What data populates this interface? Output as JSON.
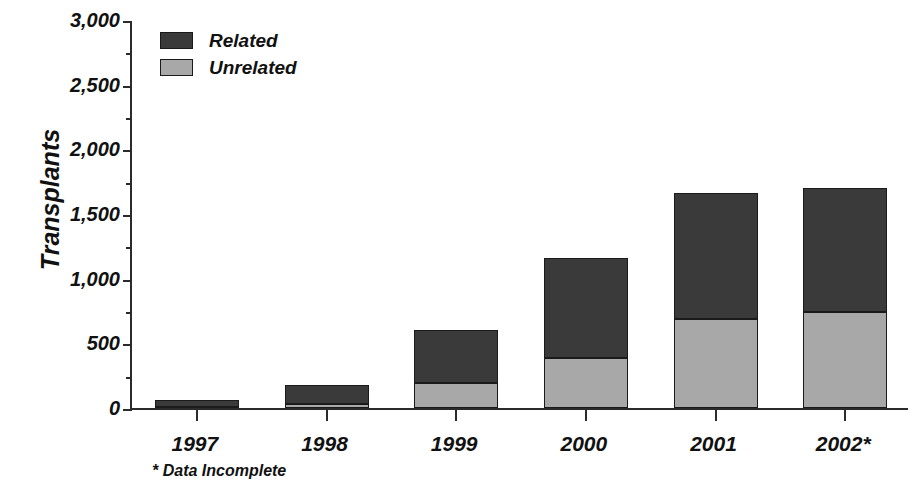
{
  "chart_data": {
    "type": "bar",
    "subtype": "stacked-bar",
    "title": "",
    "xlabel": "",
    "ylabel": "Transplants",
    "categories": [
      "1997",
      "1998",
      "1999",
      "2000",
      "2001",
      "2002*"
    ],
    "series": [
      {
        "name": "Unrelated",
        "color": "#a8a8a8",
        "values": [
          10,
          30,
          190,
          385,
          685,
          740
        ]
      },
      {
        "name": "Related",
        "color": "#3a3a3a",
        "values": [
          50,
          150,
          410,
          775,
          975,
          960
        ]
      }
    ],
    "totals": [
      60,
      180,
      600,
      1160,
      1660,
      1700
    ],
    "ylim": [
      0,
      3000
    ],
    "y_ticks": [
      0,
      500,
      1000,
      1500,
      2000,
      2500,
      3000
    ],
    "y_tick_labels": [
      "0",
      "500",
      "1,000",
      "1,500",
      "2,000",
      "2,500",
      "3,000"
    ],
    "y_minor_tick_interval": 250,
    "grid": false,
    "legend_position": "top-left-inside",
    "stack_order_bottom_to_top": [
      "Unrelated",
      "Related"
    ],
    "footnote": "* Data Incomplete"
  },
  "axes": {
    "y_title": "Transplants",
    "y_tick_labels": [
      "3,000",
      "2,500",
      "2,000",
      "1,500",
      "1,000",
      "500",
      "0"
    ],
    "x_tick_labels": [
      "1997",
      "1998",
      "1999",
      "2000",
      "2001",
      "2002*"
    ]
  },
  "legend": {
    "items": [
      {
        "label": "Related",
        "color": "#3a3a3a"
      },
      {
        "label": "Unrelated",
        "color": "#a8a8a8"
      }
    ]
  },
  "footnote": {
    "text": "* Data Incomplete"
  },
  "colors": {
    "related": "#3a3a3a",
    "unrelated": "#a8a8a8",
    "axis": "#2b2b2b",
    "text": "#111111",
    "background": "#ffffff"
  }
}
